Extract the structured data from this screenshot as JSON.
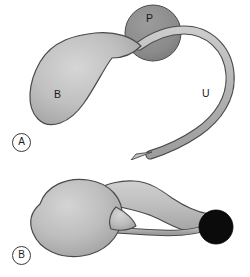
{
  "figure": {
    "width": 250,
    "height": 277,
    "background": "#ffffff",
    "type": "anatomical-line-drawing",
    "panels": [
      {
        "tag": "A",
        "description": "Bladder with long looping ureter passing over the prostate",
        "labels": [
          {
            "key": "B",
            "text": "B",
            "meaning": "bladder"
          },
          {
            "key": "P",
            "text": "P",
            "meaning": "prostate"
          },
          {
            "key": "U",
            "text": "U",
            "meaning": "ureter"
          }
        ]
      },
      {
        "tag": "B",
        "description": "Bladder with ureter running beneath the vagina to a fistula",
        "labels": [
          {
            "key": "B",
            "text": "B",
            "meaning": "bladder"
          },
          {
            "key": "C",
            "text": "C",
            "meaning": "cervix"
          },
          {
            "key": "V",
            "text": "V",
            "meaning": "vagina"
          },
          {
            "key": "U",
            "text": "U",
            "meaning": "ureter"
          },
          {
            "key": "F",
            "text": "F",
            "meaning": "fistula"
          }
        ]
      }
    ]
  },
  "panel_a": {
    "tag": "A",
    "bladder_label": "B",
    "prostate_label": "P",
    "ureter_label": "U"
  },
  "panel_b": {
    "tag": "B",
    "bladder_label": "B",
    "cervix_label": "C",
    "vagina_label": "V",
    "ureter_label": "U",
    "fistula_label": "F"
  },
  "colors": {
    "organ_light": "#c6c6c6",
    "organ_mid": "#b0b0b0",
    "organ_dark": "#9a9a9a",
    "prostate": "#8d8d8d",
    "fistula": "#0b0b0b",
    "outline": "#3f3f3f",
    "label_text": "#1a1a1a",
    "background": "#ffffff"
  }
}
